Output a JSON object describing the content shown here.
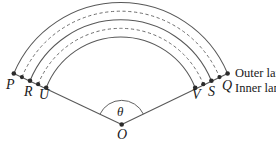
{
  "figure": {
    "type": "geometry-diagram",
    "center_label": "O",
    "angle_label": "θ",
    "points": [
      {
        "id": "P",
        "label": "P",
        "side": "left",
        "x": 13,
        "y": 74,
        "label_x": 7,
        "label_y": 78
      },
      {
        "id": "R",
        "label": "R",
        "side": "left",
        "x": 30,
        "y": 80,
        "label_x": 25,
        "label_y": 85
      },
      {
        "id": "U",
        "label": "U",
        "side": "left",
        "x": 44,
        "y": 85,
        "label_x": 40,
        "label_y": 88
      },
      {
        "id": "V",
        "label": "V",
        "side": "right",
        "x": 196,
        "y": 85,
        "label_x": 193,
        "label_y": 88
      },
      {
        "id": "S",
        "label": "S",
        "side": "right",
        "x": 211,
        "y": 80,
        "label_x": 209,
        "label_y": 85
      },
      {
        "id": "Q",
        "label": "Q",
        "side": "right",
        "x": 228,
        "y": 74,
        "label_x": 224,
        "label_y": 79
      }
    ],
    "lane_labels": [
      {
        "id": "outer",
        "text": "Outer lane",
        "x": 236,
        "y": 70
      },
      {
        "id": "inner",
        "text": "Inner lane",
        "x": 236,
        "y": 84
      }
    ],
    "arcs": [
      {
        "id": "outer-solid",
        "style": "solid",
        "radius": 116
      },
      {
        "id": "outer-dashed",
        "style": "dashed",
        "radius": 107
      },
      {
        "id": "middle-solid",
        "style": "solid",
        "radius": 98
      },
      {
        "id": "inner-dashed",
        "style": "dashed",
        "radius": 89
      },
      {
        "id": "inner-solid",
        "style": "solid",
        "radius": 80
      }
    ],
    "colors": {
      "stroke": "#555555",
      "dot": "#2b2b2b",
      "text": "#1a1a1a",
      "background": "#ffffff"
    }
  }
}
